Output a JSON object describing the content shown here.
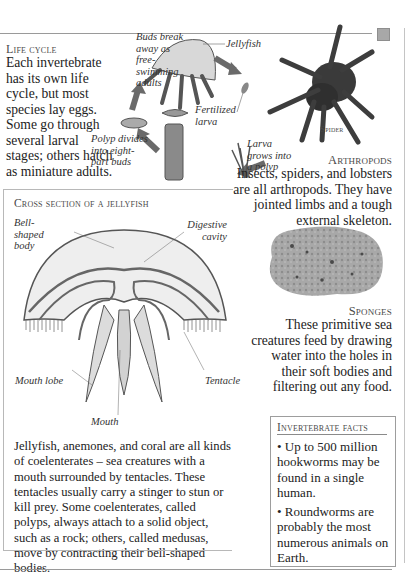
{
  "life_cycle": {
    "heading": "Life cycle",
    "body": "Each invertebrate has its own life cycle, but most species lay eggs. Some go through several larval stages; others hatch as miniature adults.",
    "labels": {
      "buds": "Buds break away as free-swimming adults",
      "jellyfish": "Jellyfish",
      "fertilized": "Fertilized larva",
      "larva_grows": "Larva grows into a polyp",
      "polyp": "Polyp divides into eight-part buds"
    }
  },
  "spider": {
    "caption": "Spider"
  },
  "arthropods": {
    "heading": "Arthropods",
    "body": "Insects, spiders, and lobsters are all arthropods. They have jointed limbs and a tough external skeleton."
  },
  "cross_section": {
    "heading": "Cross section of a jellyfish",
    "labels": {
      "bell": "Bell-shaped body",
      "digestive": "Digestive cavity",
      "mouth_lobe": "Mouth lobe",
      "tentacle": "Tentacle",
      "mouth": "Mouth"
    },
    "body": "Jellyfish, anemones, and coral are all kinds of coelenterates – sea creatures with a mouth surrounded by tentacles. These tentacles usually carry a stinger to stun or kill prey. Some coelenterates, called polyps, always attach to a solid object, such as a rock; others, called medusas, move by contracting their bell-shaped bodies."
  },
  "sponges": {
    "heading": "Sponges",
    "body": "These primitive sea creatures feed by drawing water into the holes in their soft bodies and filtering out any food."
  },
  "facts": {
    "heading": "Invertebrate facts",
    "items": [
      "• Up to 500 million hookworms may be found in a single human.",
      "• Roundworms are probably the most numerous animals on Earth."
    ]
  },
  "colors": {
    "rule": "#9a9a9a",
    "corner_square": "#a8a8a8",
    "text": "#222222"
  }
}
